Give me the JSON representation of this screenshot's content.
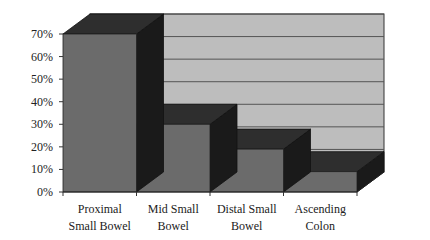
{
  "chart_data": {
    "type": "bar",
    "style": "3d",
    "title": "",
    "xlabel": "",
    "ylabel": "",
    "categories": [
      "Proximal Small Bowel",
      "Mid Small Bowel",
      "Distal Small Bowel",
      "Ascending Colon"
    ],
    "category_lines": [
      [
        "Proximal",
        "Small Bowel"
      ],
      [
        "Mid Small",
        "Bowel"
      ],
      [
        "Distal Small",
        "Bowel"
      ],
      [
        "Ascending",
        "Colon"
      ]
    ],
    "values": [
      70,
      30,
      19,
      9
    ],
    "unit": "%",
    "ylim": [
      0,
      70
    ],
    "yticks": [
      "0%",
      "10%",
      "20%",
      "30%",
      "40%",
      "50%",
      "60%",
      "70%"
    ],
    "grid": true,
    "legend": "none",
    "colors": {
      "front": "#6b6b6b",
      "top": "#2e2e2e",
      "side": "#1a1a1a",
      "wall": "#bdbdbd",
      "grid": "#555555"
    }
  }
}
